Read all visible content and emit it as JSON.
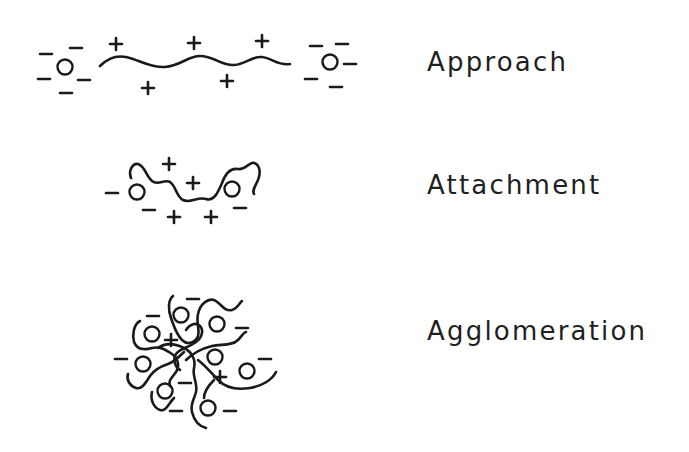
{
  "diagram": {
    "type": "flocculation-stages",
    "stages": [
      {
        "id": "approach",
        "label": "Approach",
        "label_pos": {
          "x": 427,
          "y": 49
        },
        "particles": [
          [
            65,
            67
          ],
          [
            330,
            62
          ]
        ],
        "negative_charges": [
          [
            46,
            54
          ],
          [
            76,
            48
          ],
          [
            44,
            79
          ],
          [
            84,
            80
          ],
          [
            66,
            93
          ],
          [
            316,
            46
          ],
          [
            342,
            44
          ],
          [
            350,
            64
          ],
          [
            311,
            79
          ],
          [
            336,
            87
          ]
        ],
        "positive_charges": [
          [
            116,
            44
          ],
          [
            194,
            43
          ],
          [
            262,
            41
          ],
          [
            148,
            88
          ],
          [
            227,
            81
          ]
        ]
      },
      {
        "id": "attachment",
        "label": "Attachment",
        "label_pos": {
          "x": 427,
          "y": 172
        },
        "particles": [
          [
            137,
            192
          ],
          [
            232,
            189
          ]
        ],
        "negative_charges": [
          [
            112,
            193
          ],
          [
            149,
            210
          ],
          [
            240,
            208
          ]
        ],
        "positive_charges": [
          [
            169,
            164
          ],
          [
            193,
            183
          ],
          [
            174,
            217
          ],
          [
            211,
            217
          ]
        ]
      },
      {
        "id": "agglomeration",
        "label": "Agglomeration",
        "label_pos": {
          "x": 427,
          "y": 318
        },
        "particles": [
          [
            181,
            315
          ],
          [
            217,
            324
          ],
          [
            152,
            334
          ],
          [
            215,
            357
          ],
          [
            143,
            364
          ],
          [
            247,
            371
          ],
          [
            165,
            391
          ],
          [
            208,
            408
          ]
        ],
        "negative_charges": [
          [
            193,
            299
          ],
          [
            153,
            316
          ],
          [
            242,
            328
          ],
          [
            121,
            359
          ],
          [
            265,
            359
          ],
          [
            185,
            383
          ],
          [
            176,
            411
          ],
          [
            230,
            411
          ]
        ],
        "positive_charges": [
          [
            171,
            340
          ],
          [
            220,
            377
          ]
        ]
      }
    ],
    "colors": {
      "ink": "#1a1a1a",
      "background": "#ffffff"
    }
  }
}
